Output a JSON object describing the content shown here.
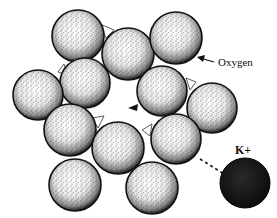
{
  "diagram": {
    "labels": {
      "oxygen": "Oxygen",
      "ion": "K+"
    },
    "colors": {
      "sphere_fill": "#ffffff",
      "sphere_stipple": "#1a1a1a",
      "ion_fill": "#161616",
      "line": "#111111"
    },
    "oxygen_spheres": [
      {
        "cx": 78,
        "cy": 36,
        "r": 26
      },
      {
        "cx": 128,
        "cy": 54,
        "r": 26
      },
      {
        "cx": 176,
        "cy": 38,
        "r": 26
      },
      {
        "cx": 85,
        "cy": 83,
        "r": 25
      },
      {
        "cx": 162,
        "cy": 91,
        "r": 25
      },
      {
        "cx": 38,
        "cy": 95,
        "r": 25
      },
      {
        "cx": 212,
        "cy": 108,
        "r": 25
      },
      {
        "cx": 70,
        "cy": 130,
        "r": 26
      },
      {
        "cx": 176,
        "cy": 139,
        "r": 25
      },
      {
        "cx": 118,
        "cy": 148,
        "r": 26
      },
      {
        "cx": 75,
        "cy": 185,
        "r": 26
      },
      {
        "cx": 152,
        "cy": 188,
        "r": 26
      }
    ],
    "ion": {
      "cx": 245,
      "cy": 183,
      "r": 25
    }
  }
}
